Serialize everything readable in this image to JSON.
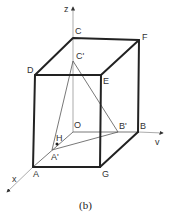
{
  "figure": {
    "caption": "(b)",
    "axes": {
      "x": "x",
      "y": "v",
      "z": "z"
    },
    "points": {
      "C": {
        "label": "C",
        "x": 73,
        "y": 38
      },
      "F": {
        "label": "F",
        "x": 139,
        "y": 40
      },
      "D": {
        "label": "D",
        "x": 35,
        "y": 75
      },
      "E": {
        "label": "E",
        "x": 101,
        "y": 75
      },
      "C_prime": {
        "label": "C'",
        "x": 73,
        "y": 61
      },
      "O": {
        "label": "O",
        "x": 73,
        "y": 132
      },
      "B_prime": {
        "label": "B'",
        "x": 118,
        "y": 132
      },
      "B": {
        "label": "B",
        "x": 138,
        "y": 132
      },
      "H": {
        "label": "H",
        "x": 57,
        "y": 144
      },
      "A_prime": {
        "label": "A'",
        "x": 52,
        "y": 150
      },
      "A": {
        "label": "A",
        "x": 33,
        "y": 167
      },
      "G": {
        "label": "G",
        "x": 100,
        "y": 167
      }
    }
  }
}
